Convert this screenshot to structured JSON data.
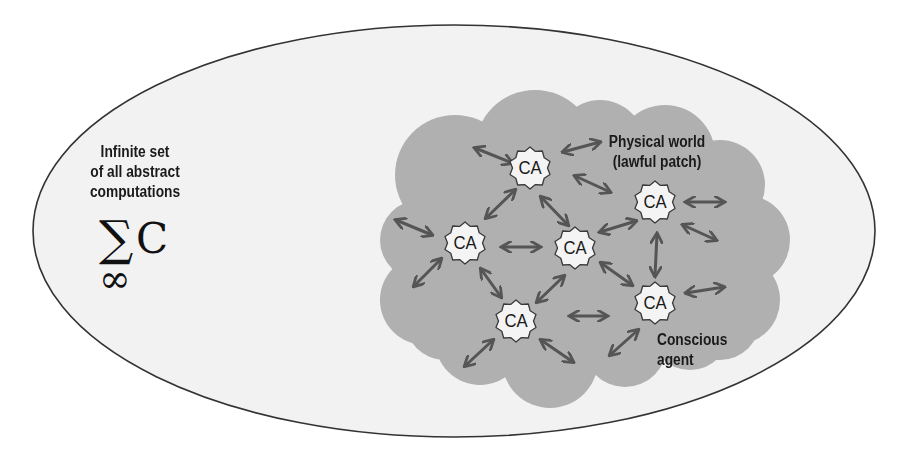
{
  "diagram": {
    "universe": {
      "label_lines": [
        "Infinite set",
        "of all abstract",
        "computations"
      ],
      "symbol_sum": "∑",
      "symbol_c": "C",
      "symbol_inf": "∞"
    },
    "physical_world": {
      "label_lines": [
        "Physical world",
        "(lawful patch)"
      ]
    },
    "agent_label_lines": [
      "Conscious",
      "agent"
    ],
    "nodes": [
      {
        "id": "ca1",
        "label": "CA",
        "x": 530,
        "y": 168
      },
      {
        "id": "ca2",
        "label": "CA",
        "x": 465,
        "y": 243
      },
      {
        "id": "ca3",
        "label": "CA",
        "x": 575,
        "y": 248
      },
      {
        "id": "ca4",
        "label": "CA",
        "x": 655,
        "y": 202
      },
      {
        "id": "ca5",
        "label": "CA",
        "x": 516,
        "y": 321
      },
      {
        "id": "ca6",
        "label": "CA",
        "x": 655,
        "y": 303
      }
    ],
    "colors": {
      "background": "#ffffff",
      "ellipse_fill": "#f2f2f2",
      "ellipse_stroke": "#333333",
      "cloud_fill": "#b0b0b0",
      "node_fill": "#f4f4f4",
      "node_stroke": "#3a3a3a",
      "arrow": "#555555",
      "text": "#1a1a1a"
    }
  }
}
